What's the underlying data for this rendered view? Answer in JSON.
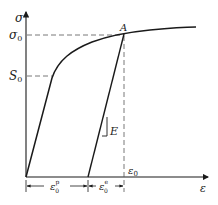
{
  "diagram": {
    "type": "stress-strain curve",
    "axes": {
      "y_label": "σ",
      "x_label": "ε"
    },
    "labels": {
      "sigma0": "σ",
      "sigma0_sub": "0",
      "S0": "S",
      "S0_sub": "0",
      "point_A": "A",
      "modulus": "E",
      "eps0": "ε",
      "eps0_sub": "0",
      "eps_plastic": "ε",
      "eps_plastic_sub": "0",
      "eps_plastic_sup": "p",
      "eps_elastic": "ε",
      "eps_elastic_sub": "0",
      "eps_elastic_sup": "e"
    },
    "colors": {
      "line": "#1a1a1a",
      "dashed": "#555555"
    }
  }
}
